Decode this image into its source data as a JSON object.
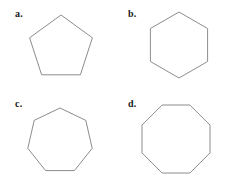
{
  "sheet": {
    "background_color": "#ffffff",
    "stroke_color": "#8c8c8c",
    "label_color": "#1a1a1a",
    "width": 225,
    "height": 181
  },
  "figures": [
    {
      "label": "a.",
      "shape_name": "pentagon",
      "sides": 5,
      "orientation": "vertex-up",
      "size": 66
    },
    {
      "label": "b.",
      "shape_name": "hexagon",
      "sides": 6,
      "orientation": "vertex-up",
      "size": 68
    },
    {
      "label": "c.",
      "shape_name": "heptagon",
      "sides": 7,
      "orientation": "vertex-up",
      "size": 68
    },
    {
      "label": "d.",
      "shape_name": "octagon",
      "sides": 8,
      "orientation": "flat-top",
      "size": 70
    }
  ]
}
